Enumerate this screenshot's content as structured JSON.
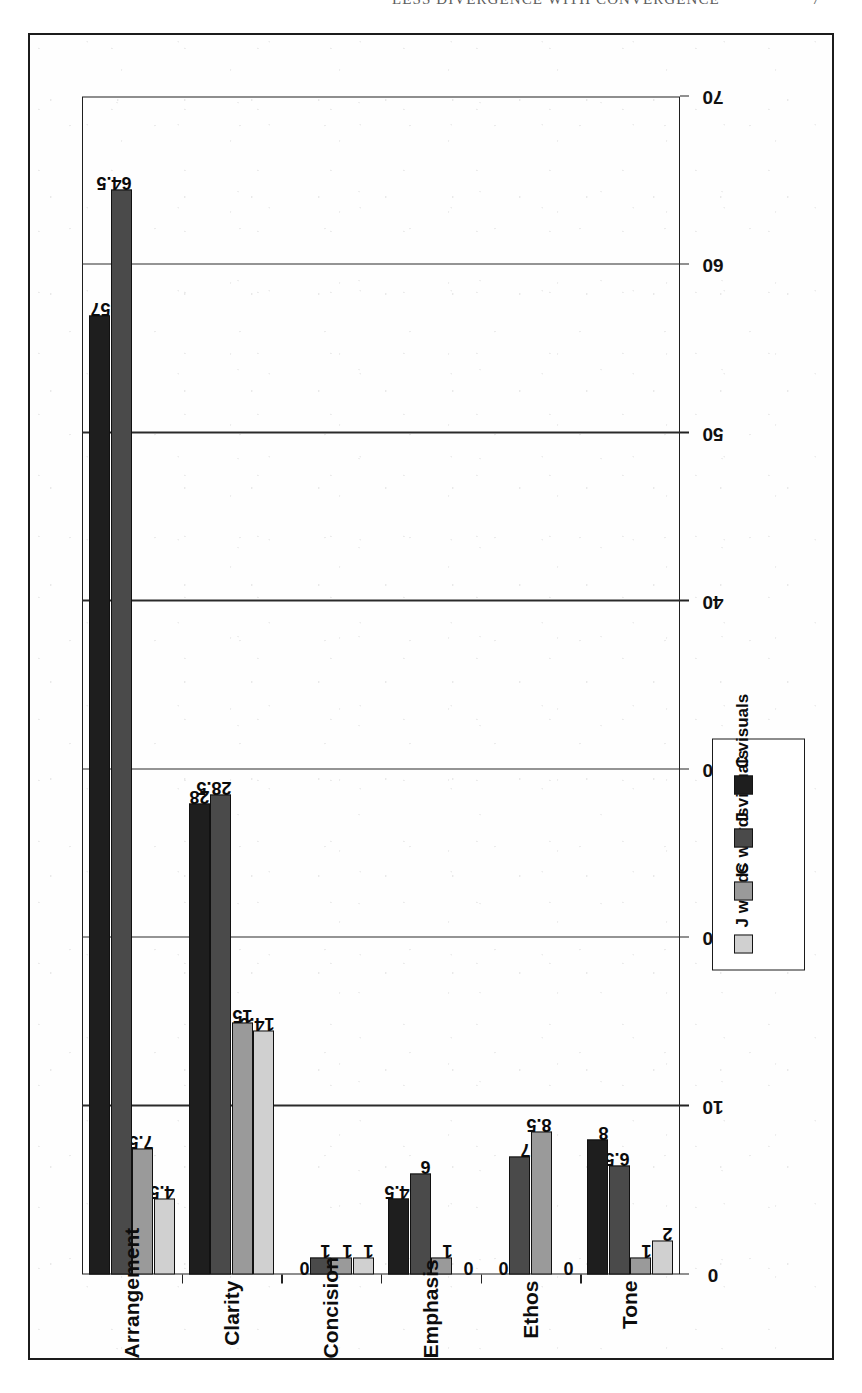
{
  "header": {
    "running_title": "LESS DIVERGENCE WITH CONVERGENCE",
    "page_number": "7"
  },
  "chart_data": {
    "type": "bar",
    "orientation": "horizontal-rotated",
    "title": "",
    "xlabel": "",
    "ylabel": "",
    "categories": [
      "Arrangement",
      "Clarity",
      "Concision",
      "Emphasis",
      "Ethos",
      "Tone"
    ],
    "series": [
      {
        "name": "J words",
        "color": "#d0d0d0",
        "values": [
          4.5,
          14.5,
          1,
          0,
          0,
          2
        ]
      },
      {
        "name": "C words",
        "color": "#9a9a9a",
        "values": [
          7.5,
          15,
          1,
          1,
          8.5,
          1
        ]
      },
      {
        "name": "J visuals",
        "color": "#4a4a4a",
        "values": [
          64.5,
          28.5,
          1,
          6,
          7,
          6.5
        ]
      },
      {
        "name": "C visuals",
        "color": "#1e1e1e",
        "values": [
          57,
          28,
          0,
          4.5,
          0,
          8
        ]
      }
    ],
    "value_ticks": [
      0,
      10,
      20,
      30,
      40,
      50,
      60,
      70
    ],
    "tick_labels": [
      "0",
      "10",
      "20",
      "30",
      "40",
      "50",
      "60",
      "70"
    ],
    "ylim": [
      0,
      70
    ],
    "grid": true,
    "legend_position": "outside-right",
    "data_labels": {
      "Arrangement": [
        "4.5",
        "7.5",
        "64.5",
        "57"
      ],
      "Clarity": [
        "14.5",
        "15",
        "28.5",
        "28"
      ],
      "Concision": [
        "1",
        "1",
        "1",
        "0"
      ],
      "Emphasis": [
        "0",
        "1",
        "6",
        "4.5"
      ],
      "Ethos": [
        "0",
        "8.5",
        "7",
        "0"
      ],
      "Tone": [
        "2",
        "1",
        "6.5",
        "8"
      ]
    }
  },
  "legend": {
    "entries": [
      {
        "label": "J words"
      },
      {
        "label": "C words"
      },
      {
        "label": "J visuals"
      },
      {
        "label": "C visuals"
      }
    ]
  }
}
